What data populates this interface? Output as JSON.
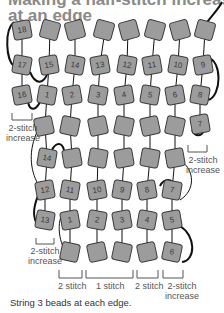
{
  "title": {
    "line1": "Making a half-stitch increase",
    "line2": "at an edge"
  },
  "colors": {
    "title": "#8a8a8a",
    "bead_fill": "#9c9c9c",
    "bead_stroke": "#3a3a3a",
    "thread": "#111111"
  },
  "beads": {
    "rowA": [
      "18",
      "",
      "",
      "",
      "",
      "",
      "",
      ""
    ],
    "rowB": [
      "17",
      "15",
      "14",
      "13",
      "12",
      "11",
      "10",
      "9"
    ],
    "rowC": [
      "16",
      "1",
      "2",
      "3",
      "4",
      "5",
      "6",
      "8"
    ],
    "rowD": [
      "",
      "",
      "",
      "",
      "",
      "",
      "7"
    ],
    "rowE": [
      "14",
      "",
      "",
      "",
      "",
      ""
    ],
    "rowF": [
      "12",
      "11",
      "10",
      "9",
      "8",
      "7"
    ],
    "rowG": [
      "13",
      "1",
      "2",
      "3",
      "4",
      "5"
    ],
    "rowH": [
      "",
      "",
      "",
      "",
      "6"
    ]
  },
  "labels": {
    "upper_left_increase": [
      "2-stitch",
      "increase"
    ],
    "upper_right_increase": [
      "2-stitch",
      "increase"
    ],
    "lower_left_increase": [
      "2-stitch",
      "increase"
    ],
    "bottom_2stitch_left": "2 stitch",
    "bottom_1stitch": "1 stitch",
    "bottom_2stitch_right": "2 stitch",
    "bottom_increase": [
      "2-stitch",
      "increase"
    ]
  },
  "caption": "String 3 beads at each edge."
}
